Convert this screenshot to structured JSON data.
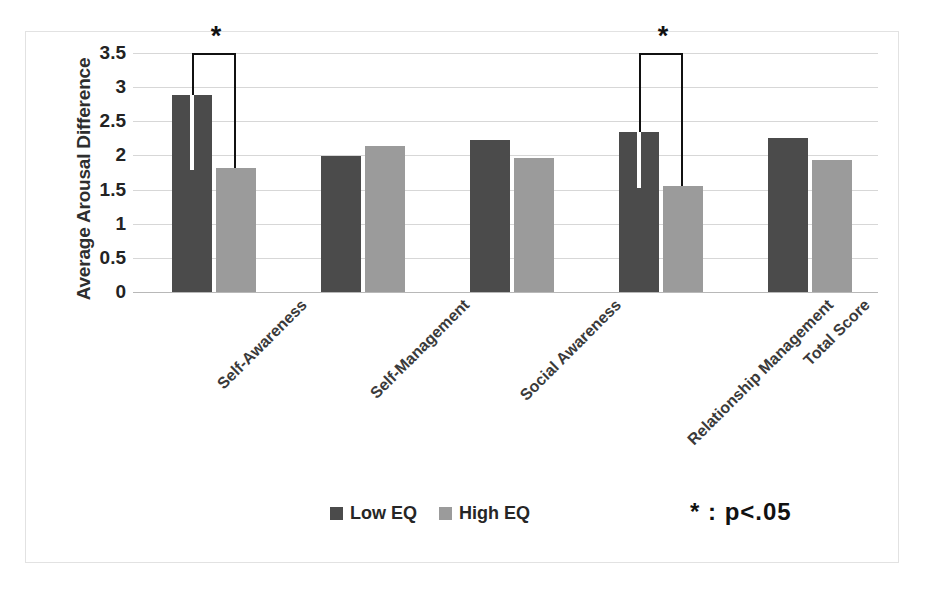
{
  "chart_data": {
    "type": "bar",
    "title": "",
    "xlabel": "",
    "ylabel": "Average Arousal Difference",
    "ylim": [
      0,
      3.5
    ],
    "ytick_step": 0.5,
    "yticks": [
      "3.5",
      "3",
      "2.5",
      "2",
      "1.5",
      "1",
      "0.5",
      "0"
    ],
    "ytick_values": [
      3.5,
      3,
      2.5,
      2,
      1.5,
      1,
      0.5,
      0
    ],
    "grid": true,
    "legend_position": "bottom-center",
    "categories": [
      "Self-Awareness",
      "Self-Management",
      "Social Awareness",
      "Relationship Management",
      "Total Score"
    ],
    "series": [
      {
        "name": "Low EQ",
        "color": "#4b4b4b",
        "values": [
          2.88,
          1.99,
          2.22,
          2.35,
          2.26
        ]
      },
      {
        "name": "High EQ",
        "color": "#9b9b9b",
        "values": [
          1.81,
          2.14,
          1.96,
          1.55,
          1.93
        ]
      }
    ],
    "annotations": [
      {
        "type": "significance-bracket",
        "category_index": 0,
        "label": "*",
        "height": 3.5
      },
      {
        "type": "significance-bracket",
        "category_index": 3,
        "label": "*",
        "height": 3.5
      }
    ],
    "footnote": "*  :  p<.05"
  },
  "legend": {
    "items": [
      {
        "label": "Low EQ",
        "color": "#4b4b4b"
      },
      {
        "label": "High EQ",
        "color": "#9b9b9b"
      }
    ]
  },
  "axes": {
    "y_title": "Average Arousal Difference"
  },
  "colors": {
    "low_eq": "#4b4b4b",
    "high_eq": "#9b9b9b",
    "gridline": "#d7d7d7",
    "frame": "#e2e2e2",
    "bracket": "#111111"
  }
}
